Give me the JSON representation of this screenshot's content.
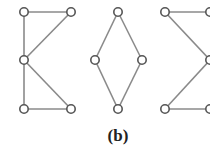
{
  "figure": {
    "caption": "(b)",
    "colors": {
      "edge": "#8a8a8a",
      "node_stroke": "#555555",
      "node_fill": "#ffffff"
    },
    "graphs": [
      {
        "name": "graph-1",
        "nodes": [
          [
            24,
            12
          ],
          [
            71,
            12
          ],
          [
            24,
            60
          ],
          [
            24,
            109
          ],
          [
            71,
            109
          ]
        ],
        "edges": [
          [
            0,
            1
          ],
          [
            0,
            2
          ],
          [
            1,
            2
          ],
          [
            2,
            3
          ],
          [
            2,
            4
          ],
          [
            3,
            4
          ]
        ]
      },
      {
        "name": "graph-2",
        "nodes": [
          [
            118,
            12
          ],
          [
            95,
            60
          ],
          [
            142,
            60
          ],
          [
            118,
            109
          ]
        ],
        "edges": [
          [
            0,
            1
          ],
          [
            0,
            2
          ],
          [
            1,
            3
          ],
          [
            2,
            3
          ]
        ]
      },
      {
        "name": "graph-3",
        "nodes": [
          [
            165,
            12
          ],
          [
            210,
            12
          ],
          [
            210,
            60
          ],
          [
            165,
            109
          ],
          [
            210,
            109
          ]
        ],
        "edges": [
          [
            0,
            1
          ],
          [
            0,
            2
          ],
          [
            2,
            3
          ],
          [
            3,
            4
          ]
        ]
      }
    ]
  }
}
